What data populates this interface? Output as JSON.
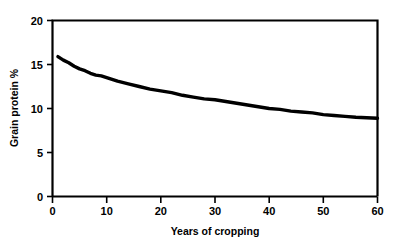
{
  "chart_data": {
    "type": "line",
    "title": "",
    "xlabel": "Years of cropping",
    "ylabel": "Grain protein %",
    "xlim": [
      0,
      60
    ],
    "ylim": [
      0,
      20
    ],
    "xticks": [
      0,
      10,
      20,
      30,
      40,
      50,
      60
    ],
    "yticks": [
      0,
      5,
      10,
      15,
      20
    ],
    "xtick_labels": [
      "0",
      "10",
      "20",
      "30",
      "40",
      "50",
      "60"
    ],
    "ytick_labels": [
      "0",
      "5",
      "10",
      "15",
      "20"
    ],
    "grid": false,
    "legend": null,
    "series": [
      {
        "name": "Grain protein %",
        "x": [
          1,
          2,
          3,
          4,
          5,
          6,
          7,
          8,
          9,
          10,
          12,
          14,
          16,
          18,
          20,
          22,
          24,
          26,
          28,
          30,
          32,
          34,
          36,
          38,
          40,
          42,
          44,
          46,
          48,
          50,
          52,
          54,
          56,
          58,
          60
        ],
        "y": [
          15.9,
          15.5,
          15.2,
          14.8,
          14.5,
          14.3,
          14.0,
          13.8,
          13.7,
          13.5,
          13.1,
          12.8,
          12.5,
          12.2,
          12.0,
          11.8,
          11.5,
          11.3,
          11.1,
          11.0,
          10.8,
          10.6,
          10.4,
          10.2,
          10.0,
          9.9,
          9.7,
          9.6,
          9.5,
          9.3,
          9.2,
          9.1,
          9.0,
          8.95,
          8.9
        ]
      }
    ]
  },
  "axes": {
    "x_title": "Years of cropping",
    "y_title": "Grain protein %",
    "x_labels": [
      "0",
      "10",
      "20",
      "30",
      "40",
      "50",
      "60"
    ],
    "y_labels": [
      "0",
      "5",
      "10",
      "15",
      "20"
    ]
  },
  "colors": {
    "background": "#ffffff",
    "axis": "#000000",
    "curve": "#000000"
  }
}
